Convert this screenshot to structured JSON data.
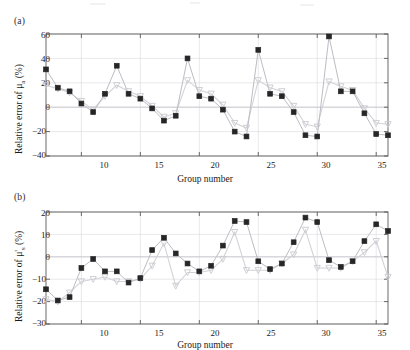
{
  "figure": {
    "width": 410,
    "height": 350,
    "background": "#ffffff"
  },
  "panels": [
    {
      "tag": "(a)",
      "ylabel_html": "Relative error of μ<sub>a</sub> (%)",
      "xlabel": "Group number"
    },
    {
      "tag": "(b)",
      "ylabel_html": "Relative error of μ'<sub>s</sub> (%)",
      "xlabel": "Group number"
    }
  ],
  "style": {
    "marker_primary_color": "#262626",
    "marker_secondary_color": "#c9c9cf",
    "line_secondary_color": "#d2d2d8",
    "line_primary_color": "#bcbcc4",
    "axis_color": "#5a5a5a",
    "grid_color": "#d8d8dd",
    "text_color": "#1a1a1a"
  },
  "chart_data": [
    {
      "type": "scatter",
      "panel": "(a)",
      "title": "",
      "xlabel": "Group number",
      "ylabel": "Relative error of μ_a (%)",
      "xlim": [
        7,
        36
      ],
      "ylim": [
        -40,
        60
      ],
      "yticks": [
        -40,
        -20,
        0,
        20,
        40,
        60
      ],
      "xticks": [
        10,
        15,
        20,
        25,
        30,
        35
      ],
      "grid": true,
      "legend": "none",
      "x": [
        7,
        8,
        9,
        10,
        11,
        12,
        13,
        14,
        15,
        16,
        17,
        18,
        19,
        20,
        21,
        22,
        23,
        24,
        25,
        26,
        27,
        28,
        29,
        30,
        31,
        32,
        33,
        34,
        35,
        36
      ],
      "series": [
        {
          "name": "measured",
          "marker": "filled-square",
          "color": "#262626",
          "values": [
            31,
            16,
            13,
            3,
            -4,
            11,
            34,
            11,
            7,
            -1,
            -11,
            -7,
            40,
            9,
            7,
            -2,
            -20,
            -24,
            47,
            11,
            9,
            -4,
            -23,
            -24,
            58,
            13,
            13,
            -5,
            -22,
            -23
          ]
        },
        {
          "name": "reference",
          "marker": "open-triangle",
          "color": "#c9c9cf",
          "values": [
            18,
            15,
            12,
            5,
            -2,
            9,
            18,
            13,
            9,
            1,
            -8,
            -5,
            22,
            14,
            11,
            2,
            -13,
            -17,
            22,
            16,
            13,
            1,
            -14,
            -16,
            21,
            17,
            14,
            -1,
            -13,
            -14
          ]
        }
      ]
    },
    {
      "type": "scatter",
      "panel": "(b)",
      "title": "",
      "xlabel": "Group number",
      "ylabel": "Relative error of μ'_s (%)",
      "xlim": [
        7,
        36
      ],
      "ylim": [
        -30,
        20
      ],
      "yticks": [
        -30,
        -20,
        -10,
        0,
        10,
        20
      ],
      "xticks": [
        10,
        15,
        20,
        25,
        30,
        35
      ],
      "grid": true,
      "legend": "none",
      "x": [
        7,
        8,
        9,
        10,
        11,
        12,
        13,
        14,
        15,
        16,
        17,
        18,
        19,
        20,
        21,
        22,
        23,
        24,
        25,
        26,
        27,
        28,
        29,
        30,
        31,
        32,
        33,
        34,
        35,
        36
      ],
      "series": [
        {
          "name": "measured",
          "marker": "filled-square",
          "color": "#262626",
          "values": [
            -14.5,
            -19.5,
            -18,
            -5,
            -1,
            -6.5,
            -6.5,
            -11.5,
            -9.5,
            3,
            8.5,
            1.5,
            -3,
            -6.5,
            -4,
            5,
            16,
            15.5,
            -2,
            -5.5,
            -3,
            6.5,
            17.5,
            15.5,
            -1.5,
            -4.5,
            -2,
            7,
            14.5,
            11.5
          ]
        },
        {
          "name": "reference",
          "marker": "open-triangle",
          "color": "#c9c9cf",
          "values": [
            -19,
            -20,
            -16,
            -11,
            -10,
            -9,
            -11,
            -11,
            -10,
            -4,
            6,
            -13,
            -7,
            -7,
            -6,
            -1,
            11,
            -6,
            -6,
            -6,
            -3,
            1,
            12,
            -5,
            -5,
            -5,
            -2,
            2,
            7,
            -9
          ]
        }
      ]
    }
  ]
}
